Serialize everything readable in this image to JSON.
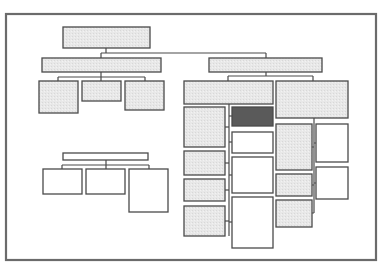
{
  "diagram": {
    "type": "org-chart-wireframe",
    "title": "",
    "labels_visible": false,
    "colors": {
      "frame": "#6b6b6b",
      "line": "#4a4a4a",
      "gray_fill": "#e6e6e6",
      "white_fill": "#ffffff",
      "highlight_fill": "#5a5a5a"
    },
    "trees": [
      {
        "name": "root-tree",
        "root": {
          "fill": "gray",
          "children": [
            "left-branch",
            "right-branch"
          ]
        },
        "branches": [
          {
            "name": "left-branch",
            "node": {
              "fill": "gray"
            },
            "children": [
              {
                "fill": "gray"
              },
              {
                "fill": "gray"
              },
              {
                "fill": "gray"
              }
            ]
          },
          {
            "name": "right-branch",
            "node": {
              "fill": "gray"
            },
            "children": [
              {
                "name": "right-left-group",
                "node": {
                  "fill": "gray"
                },
                "columns": [
                  {
                    "fill": "gray",
                    "count": 4
                  },
                  {
                    "fills": [
                      "highlight",
                      "white",
                      "white",
                      "white"
                    ]
                  }
                ]
              },
              {
                "name": "right-right-group",
                "node": {
                  "fill": "gray"
                },
                "columns": [
                  {
                    "fill": "gray",
                    "count": 3
                  },
                  {
                    "fill": "white",
                    "count": 2
                  }
                ]
              }
            ]
          }
        ]
      },
      {
        "name": "standalone-tree",
        "root": {
          "fill": "white"
        },
        "children": [
          {
            "fill": "white"
          },
          {
            "fill": "white"
          },
          {
            "fill": "white"
          }
        ]
      }
    ]
  }
}
